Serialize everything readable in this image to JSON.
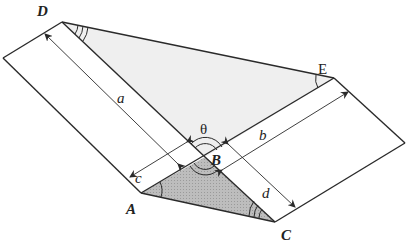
{
  "diagram": {
    "type": "geometry-figure",
    "colors": {
      "line": "#2a2a2a",
      "light_fill": "#eeeeee",
      "dark_fill": "#b4b4b4",
      "background": "#ffffff"
    },
    "points": {
      "D": {
        "label": "D",
        "x": 62,
        "y": 22
      },
      "E": {
        "label": "E",
        "x": 334,
        "y": 78
      },
      "B": {
        "label": "B",
        "x": 205,
        "y": 157
      },
      "A": {
        "label": "A",
        "x": 141,
        "y": 193
      },
      "C": {
        "label": "C",
        "x": 275,
        "y": 222
      }
    },
    "labels": {
      "D": "D",
      "E": "E",
      "B": "B",
      "A": "A",
      "C": "C",
      "theta": "θ",
      "a": "a",
      "b": "b",
      "c": "c",
      "d": "d"
    },
    "dimensions": [
      {
        "name": "a",
        "from": "strip-left-top",
        "to": "strip-left-bottom",
        "orientation": "along left strip length"
      },
      {
        "name": "b",
        "from": "strip-right",
        "to": "strip-right",
        "orientation": "along right strip length"
      },
      {
        "name": "c",
        "orientation": "width of left strip"
      },
      {
        "name": "d",
        "orientation": "width of right strip"
      }
    ],
    "angle_marks": [
      {
        "vertex": "D",
        "arcs": 3
      },
      {
        "vertex": "E",
        "arcs": 1
      },
      {
        "vertex": "B",
        "arcs": 2,
        "note": "theta angle above B"
      },
      {
        "vertex": "B",
        "arcs": 2,
        "note": "angle below B"
      },
      {
        "vertex": "A",
        "arcs": 1
      },
      {
        "vertex": "C",
        "arcs": 3
      }
    ]
  }
}
